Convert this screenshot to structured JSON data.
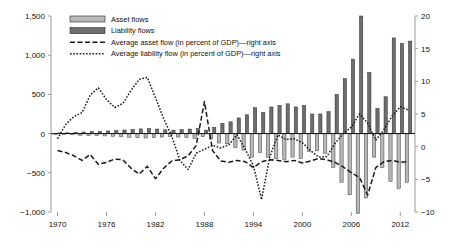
{
  "chart_data": {
    "type": "bar",
    "title": "",
    "subtitle": "",
    "xlabel": "",
    "ylabel": "",
    "y2label": "",
    "grid": false,
    "legend_position": "top-left",
    "xlim": [
      1969.2,
      2013.8
    ],
    "ylim": [
      -1000,
      1500
    ],
    "y2lim": [
      -10,
      20
    ],
    "xticks": [
      1970,
      1976,
      1982,
      1988,
      1994,
      2000,
      2006,
      2012
    ],
    "xtick_labels": [
      "1970",
      "1976",
      "1982",
      "1988",
      "1994",
      "2000",
      "2006",
      "2012"
    ],
    "yticks": [
      -1000,
      -500,
      0,
      500,
      1000,
      1500
    ],
    "ytick_labels": [
      "−1,000",
      "−500",
      "0",
      "500",
      "1,000",
      "1,500"
    ],
    "y2ticks": [
      -10,
      -5,
      0,
      5,
      10,
      15,
      20
    ],
    "y2tick_labels": [
      "−10",
      "−5",
      "0",
      "5",
      "10",
      "15",
      "20"
    ],
    "x": [
      1970,
      1971,
      1972,
      1973,
      1974,
      1975,
      1976,
      1977,
      1978,
      1979,
      1980,
      1981,
      1982,
      1983,
      1984,
      1985,
      1986,
      1987,
      1988,
      1989,
      1990,
      1991,
      1992,
      1993,
      1994,
      1995,
      1996,
      1997,
      1998,
      1999,
      2000,
      2001,
      2002,
      2003,
      2004,
      2005,
      2006,
      2007,
      2008,
      2009,
      2010,
      2011,
      2012,
      2013
    ],
    "series": [
      {
        "name": "Asset flows",
        "type": "bar",
        "axis": "left",
        "color": "#b8b8b8",
        "edge_color": "#3a3a3a",
        "values": [
          -8,
          -10,
          -14,
          -20,
          -24,
          -26,
          -30,
          -34,
          -40,
          -46,
          -52,
          -56,
          -52,
          -44,
          -40,
          -44,
          -52,
          -60,
          -40,
          -70,
          -120,
          -130,
          -180,
          -210,
          -300,
          -240,
          -300,
          -320,
          -330,
          -300,
          -320,
          -230,
          -220,
          -250,
          -430,
          -620,
          -780,
          -1020,
          -820,
          -300,
          -430,
          -610,
          -700,
          -620
        ]
      },
      {
        "name": "Liability flows",
        "type": "bar",
        "axis": "left",
        "color": "#6e6e6e",
        "edge_color": "#2a2a2a",
        "values": [
          8,
          10,
          14,
          20,
          26,
          30,
          34,
          38,
          46,
          54,
          60,
          64,
          58,
          48,
          44,
          50,
          58,
          66,
          44,
          80,
          130,
          150,
          200,
          240,
          330,
          270,
          340,
          360,
          380,
          340,
          360,
          250,
          250,
          280,
          500,
          700,
          950,
          1500,
          780,
          320,
          470,
          1220,
          1150,
          1180
        ]
      },
      {
        "name": "Average asset flow (in percent of GDP)—right axis",
        "type": "line",
        "style": "dashed",
        "axis": "right",
        "color": "#1a1a1a",
        "values": [
          -0.6,
          -0.9,
          -1.4,
          -2.1,
          -1.2,
          -2.7,
          -2.4,
          -1.9,
          -2.0,
          -3.3,
          -4.2,
          -3.0,
          -4.9,
          -3.3,
          -2.2,
          -2.0,
          -1.4,
          0.2,
          6.9,
          -0.6,
          -2.2,
          -2.4,
          -2.1,
          -2.3,
          -3.2,
          -2.3,
          -2.0,
          -2.1,
          -2.3,
          -2.1,
          -2.5,
          -2.2,
          -1.8,
          -2.0,
          -2.4,
          -3.1,
          -4.0,
          -4.7,
          -7.4,
          -3.2,
          -2.3,
          -2.1,
          -2.4,
          -2.3
        ]
      },
      {
        "name": "Average liability flow (in percent of GDP)—right axis",
        "type": "line",
        "style": "dotted",
        "axis": "right",
        "color": "#1a1a1a",
        "values": [
          1.2,
          3.4,
          4.6,
          5.2,
          7.9,
          9.0,
          7.2,
          6.0,
          6.6,
          8.6,
          10.3,
          10.6,
          7.5,
          4.3,
          1.6,
          -2.1,
          -3.5,
          -1.0,
          -0.4,
          0.2,
          -0.2,
          0.3,
          1.8,
          -0.4,
          -2.9,
          -8.1,
          -1.6,
          1.8,
          1.1,
          1.2,
          0.6,
          -0.6,
          -1.6,
          -1.5,
          0.5,
          2.0,
          3.0,
          5.0,
          3.6,
          1.0,
          2.6,
          4.7,
          6.1,
          5.6
        ]
      }
    ],
    "legend": [
      {
        "label": "Asset flows",
        "kind": "swatch",
        "color": "#b8b8b8"
      },
      {
        "label": "Liability flows",
        "kind": "swatch",
        "color": "#6e6e6e"
      },
      {
        "label": "Average asset flow (in percent of GDP)—right axis",
        "kind": "dashed-line",
        "color": "#1a1a1a"
      },
      {
        "label": "Average liability flow (in percent of GDP)—right axis",
        "kind": "dotted-line",
        "color": "#1a1a1a"
      }
    ]
  }
}
